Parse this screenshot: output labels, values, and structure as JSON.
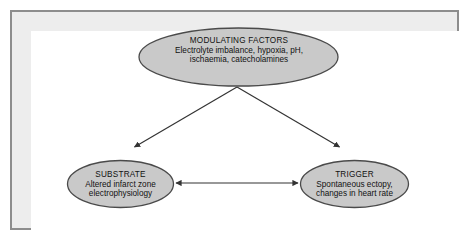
{
  "figure": {
    "type": "flow-diagram",
    "background_color": "#ffffff",
    "frame_border_color": "#8d8d8d",
    "frame_inner_color": "#ededed",
    "node_fill_color": "#c9c9c9",
    "node_stroke_color": "#4a4a4a",
    "arrow_color": "#333333"
  },
  "nodes": {
    "modulating_factors": {
      "title": "MODULATING FACTORS",
      "line2": "Electrolyte imbalance, hypoxia, pH,",
      "line3": "ischaemia, catecholamines"
    },
    "substrate": {
      "title": "SUBSTRATE",
      "line2": "Altered infarct zone",
      "line3": "electrophysiology"
    },
    "trigger": {
      "title": "TRIGGER",
      "line2": "Spontaneous ectopy,",
      "line3": "changes in heart rate"
    }
  },
  "connectors": [
    {
      "name": "modulating-to-substrate",
      "from": "modulating_factors",
      "to": "substrate",
      "style": "single-arrow"
    },
    {
      "name": "modulating-to-trigger",
      "from": "modulating_factors",
      "to": "trigger",
      "style": "single-arrow"
    },
    {
      "name": "substrate-trigger-bidirectional",
      "from": "substrate",
      "to": "trigger",
      "style": "double-arrow"
    }
  ]
}
